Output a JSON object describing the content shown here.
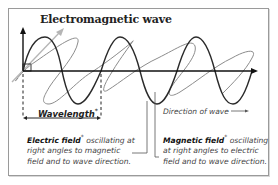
{
  "diagram": {
    "title": "Electromagnetic wave",
    "wavelength_label": "Wavelength",
    "direction_label": "Direction of wave",
    "electric": {
      "term": "Electric field",
      "description": "oscillating at right angles to magnetic field and to wave direction."
    },
    "magnetic": {
      "term": "Magnetic field",
      "description": "oscillating at right angles to electric field and to wave direction."
    },
    "marker": "*",
    "colors": {
      "electric_wave": "#2a2a2a",
      "magnetic_wave": "#8c8c8c",
      "magnetic_axis": "#aaaaaa",
      "frame": "#9a9a9a",
      "text": "#444444"
    }
  }
}
